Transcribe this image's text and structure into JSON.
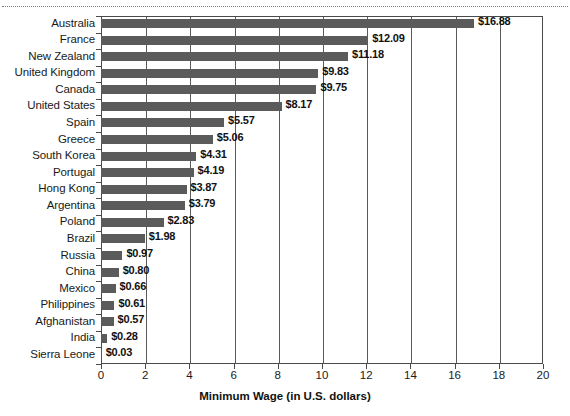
{
  "chart_data": {
    "type": "bar",
    "orientation": "horizontal",
    "title": "",
    "xlabel": "Minimum Wage (in U.S. dollars)",
    "ylabel": "",
    "xlim": [
      0,
      20
    ],
    "xticks": [
      0,
      2,
      4,
      6,
      8,
      10,
      12,
      14,
      16,
      18,
      20
    ],
    "xtick_labels": [
      "0",
      "2",
      "4",
      "6",
      "8",
      "10",
      "12",
      "14",
      "16",
      "18",
      "20"
    ],
    "grid": "vertical",
    "legend": "none",
    "bar_color": "#5b5b5b",
    "categories": [
      "Australia",
      "France",
      "New Zealand",
      "United Kingdom",
      "Canada",
      "United States",
      "Spain",
      "Greece",
      "South Korea",
      "Portugal",
      "Hong Kong",
      "Argentina",
      "Poland",
      "Brazil",
      "Russia",
      "China",
      "Mexico",
      "Philippines",
      "Afghanistan",
      "India",
      "Sierra Leone"
    ],
    "values": [
      16.88,
      12.09,
      11.18,
      9.83,
      9.75,
      8.17,
      5.57,
      5.06,
      4.31,
      4.19,
      3.87,
      3.79,
      2.83,
      1.98,
      0.97,
      0.8,
      0.66,
      0.61,
      0.57,
      0.28,
      0.03
    ],
    "value_labels": [
      "$16.88",
      "$12.09",
      "$11.18",
      "$9.83",
      "$9.75",
      "$8.17",
      "$5.57",
      "$5.06",
      "$4.31",
      "$4.19",
      "$3.87",
      "$3.79",
      "$2.83",
      "$1.98",
      "$0.97",
      "$0.80",
      "$0.66",
      "$0.61",
      "$0.57",
      "$0.28",
      "$0.03"
    ]
  }
}
